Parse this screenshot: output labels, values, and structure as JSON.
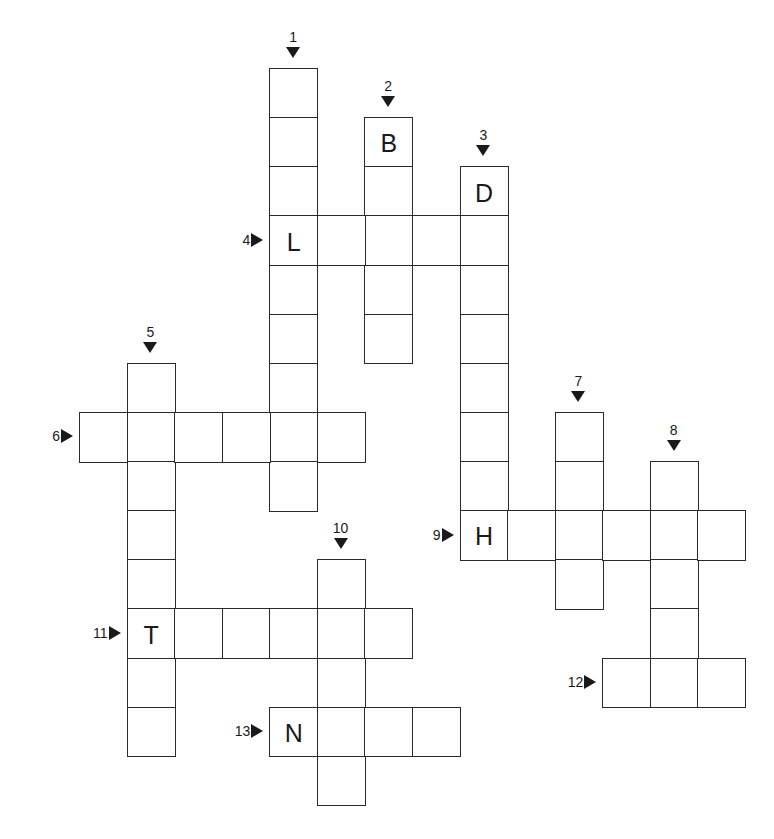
{
  "puzzle": {
    "geometry": {
      "x0": 79,
      "y0": 68,
      "cell_w": 47.57,
      "cell_h": 49.13
    },
    "entries": [
      {
        "number": "1",
        "direction": "down",
        "col": 4,
        "row": 0,
        "length": 9,
        "given": {}
      },
      {
        "number": "2",
        "direction": "down",
        "col": 6,
        "row": 1,
        "length": 5,
        "given": {
          "0": "B"
        }
      },
      {
        "number": "3",
        "direction": "down",
        "col": 8,
        "row": 2,
        "length": 8,
        "given": {
          "0": "D"
        }
      },
      {
        "number": "4",
        "direction": "across",
        "col": 4,
        "row": 3,
        "length": 5,
        "given": {
          "0": "L"
        }
      },
      {
        "number": "5",
        "direction": "down",
        "col": 1,
        "row": 6,
        "length": 8,
        "given": {}
      },
      {
        "number": "6",
        "direction": "across",
        "col": 0,
        "row": 7,
        "length": 6,
        "given": {}
      },
      {
        "number": "7",
        "direction": "down",
        "col": 10,
        "row": 7,
        "length": 4,
        "given": {}
      },
      {
        "number": "8",
        "direction": "down",
        "col": 12,
        "row": 8,
        "length": 5,
        "given": {}
      },
      {
        "number": "9",
        "direction": "across",
        "col": 8,
        "row": 9,
        "length": 6,
        "given": {
          "0": "H"
        }
      },
      {
        "number": "10",
        "direction": "down",
        "col": 5,
        "row": 10,
        "length": 5,
        "given": {}
      },
      {
        "number": "11",
        "direction": "across",
        "col": 1,
        "row": 11,
        "length": 6,
        "given": {
          "0": "T"
        }
      },
      {
        "number": "12",
        "direction": "across",
        "col": 11,
        "row": 12,
        "length": 3,
        "given": {}
      },
      {
        "number": "13",
        "direction": "across",
        "col": 4,
        "row": 13,
        "length": 4,
        "given": {
          "0": "N"
        }
      }
    ],
    "colors": {
      "line": "#2a2a2a",
      "text": "#1a1a1a",
      "background": "#ffffff"
    }
  }
}
